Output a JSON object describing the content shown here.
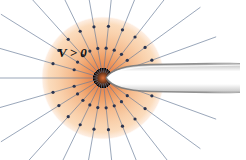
{
  "figure": {
    "background_color": "#ffffff",
    "width": 246,
    "height": 160
  },
  "annotations": [
    {
      "id": "potential-label",
      "text": "V > 0",
      "x": 58,
      "y": 57,
      "color": "#111111",
      "style": "italic-serif"
    }
  ],
  "colors": {
    "disk_center": "#e07a42",
    "disk_mid": "#f2a670",
    "disk_outer": "#f9cfa9",
    "disk_edge": "#fce3cd",
    "streamline": "#6b7d99",
    "dot": "#2b3550",
    "body_fill": "#ffffff",
    "body_edge": "#8c8c8c",
    "body_shade": "#d8d8d8"
  },
  "chart_data": {
    "type": "scatter",
    "xlabel": "",
    "ylabel": "",
    "xlim": [
      0,
      246
    ],
    "ylim": [
      0,
      160
    ],
    "grid": false,
    "legend": "none",
    "source_point": {
      "x": 103,
      "y": 78
    },
    "disk": {
      "cx": 103,
      "cy": 78,
      "r": 60,
      "stops": [
        0,
        22,
        48,
        70,
        100
      ]
    },
    "streamlines": {
      "count": 22,
      "origin": {
        "x": 103,
        "y": 78
      },
      "angles_deg": [
        4,
        20,
        36,
        52,
        68,
        84,
        100,
        116,
        132,
        148,
        164,
        180,
        196,
        212,
        228,
        244,
        260,
        276,
        292,
        308,
        324,
        340
      ],
      "inner_radius": 6,
      "outer_radius": 120,
      "color": "#6b7d99",
      "width": 0.8
    },
    "markers": {
      "ring_radii": [
        30,
        52
      ],
      "radius_px": 1.6,
      "color": "#2b3550",
      "angles_deg": [
        4,
        20,
        36,
        52,
        68,
        84,
        100,
        116,
        132,
        148,
        164,
        196,
        212,
        228,
        244,
        260,
        276,
        292,
        308,
        324,
        340
      ]
    },
    "body": {
      "name": "wedge-nose",
      "apex": {
        "x": 106,
        "y": 78
      },
      "upper_edge_y_at_right": 72,
      "lower_edge_y_at_right": 88,
      "right_extent_x": 240,
      "fill": "#ffffff",
      "edge_color": "#8c8c8c"
    }
  }
}
